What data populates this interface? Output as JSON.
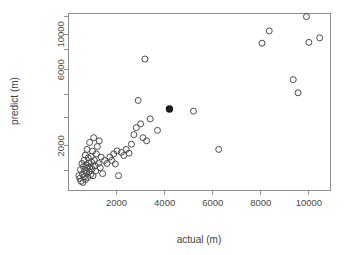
{
  "chart_data": {
    "type": "scatter",
    "title": "",
    "xlabel": "actual (m)",
    "ylabel": "predict (m)",
    "xscale": "linear",
    "yscale": "log",
    "xlim": [
      0,
      10900
    ],
    "ylim": [
      1050,
      13500
    ],
    "grid": false,
    "legend": null,
    "xticks": [
      2000,
      4000,
      6000,
      8000,
      10000
    ],
    "xtick_labels": [
      "2000",
      "4000",
      "6000",
      "8000",
      "10000"
    ],
    "yticks": [
      2000,
      6000,
      10000
    ],
    "ytick_labels": [
      "2000",
      "6000",
      "10000"
    ],
    "yticks_minor": [
      1400,
      3000,
      4200,
      8000,
      13000
    ],
    "marker": "open-circle",
    "marker_size": 3.0,
    "marker_color": "#4d4d4d",
    "highlight_marker_color": "#1c1c1c",
    "points": [
      {
        "x": 430,
        "y": 1300
      },
      {
        "x": 470,
        "y": 1250
      },
      {
        "x": 500,
        "y": 1420
      },
      {
        "x": 520,
        "y": 1200
      },
      {
        "x": 560,
        "y": 1550
      },
      {
        "x": 580,
        "y": 1330
      },
      {
        "x": 600,
        "y": 1180
      },
      {
        "x": 620,
        "y": 1480
      },
      {
        "x": 650,
        "y": 1620
      },
      {
        "x": 660,
        "y": 1280
      },
      {
        "x": 680,
        "y": 1400
      },
      {
        "x": 700,
        "y": 1750
      },
      {
        "x": 710,
        "y": 1230
      },
      {
        "x": 730,
        "y": 1520
      },
      {
        "x": 750,
        "y": 1350
      },
      {
        "x": 770,
        "y": 1900
      },
      {
        "x": 790,
        "y": 1450
      },
      {
        "x": 800,
        "y": 1270
      },
      {
        "x": 820,
        "y": 1680
      },
      {
        "x": 840,
        "y": 1560
      },
      {
        "x": 860,
        "y": 1380
      },
      {
        "x": 880,
        "y": 2100
      },
      {
        "x": 900,
        "y": 1480
      },
      {
        "x": 920,
        "y": 1320
      },
      {
        "x": 940,
        "y": 1720
      },
      {
        "x": 960,
        "y": 1580
      },
      {
        "x": 980,
        "y": 1430
      },
      {
        "x": 1000,
        "y": 1850
      },
      {
        "x": 1020,
        "y": 1300
      },
      {
        "x": 1050,
        "y": 2250
      },
      {
        "x": 1080,
        "y": 1620
      },
      {
        "x": 1100,
        "y": 1500
      },
      {
        "x": 1130,
        "y": 1390
      },
      {
        "x": 1160,
        "y": 1780
      },
      {
        "x": 1200,
        "y": 1980
      },
      {
        "x": 1240,
        "y": 1550
      },
      {
        "x": 1280,
        "y": 2150
      },
      {
        "x": 1320,
        "y": 1460
      },
      {
        "x": 1360,
        "y": 1700
      },
      {
        "x": 1420,
        "y": 1340
      },
      {
        "x": 1500,
        "y": 1620
      },
      {
        "x": 1600,
        "y": 1550
      },
      {
        "x": 1720,
        "y": 1700
      },
      {
        "x": 1800,
        "y": 1620
      },
      {
        "x": 1880,
        "y": 1780
      },
      {
        "x": 1950,
        "y": 1540
      },
      {
        "x": 2020,
        "y": 1860
      },
      {
        "x": 2080,
        "y": 1300
      },
      {
        "x": 2200,
        "y": 1820
      },
      {
        "x": 2300,
        "y": 1740
      },
      {
        "x": 2400,
        "y": 1900
      },
      {
        "x": 2520,
        "y": 1800
      },
      {
        "x": 2620,
        "y": 2050
      },
      {
        "x": 2720,
        "y": 2350
      },
      {
        "x": 2820,
        "y": 2600
      },
      {
        "x": 2900,
        "y": 3850
      },
      {
        "x": 3000,
        "y": 2750
      },
      {
        "x": 3100,
        "y": 2250
      },
      {
        "x": 3180,
        "y": 7000
      },
      {
        "x": 3250,
        "y": 2150
      },
      {
        "x": 3400,
        "y": 2950
      },
      {
        "x": 3700,
        "y": 2500
      },
      {
        "x": 4200,
        "y": 3400,
        "highlight": true
      },
      {
        "x": 5200,
        "y": 3300
      },
      {
        "x": 6250,
        "y": 1900
      },
      {
        "x": 8050,
        "y": 8800
      },
      {
        "x": 8350,
        "y": 10500
      },
      {
        "x": 9350,
        "y": 5200
      },
      {
        "x": 9550,
        "y": 4300
      },
      {
        "x": 9900,
        "y": 12900
      },
      {
        "x": 10000,
        "y": 8900
      },
      {
        "x": 10450,
        "y": 9500
      }
    ]
  },
  "axes": {
    "x_title": "actual (m)",
    "y_title": "predict (m)"
  }
}
